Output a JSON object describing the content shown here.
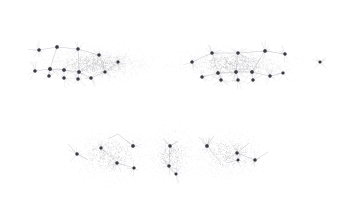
{
  "figure": {
    "title": "",
    "subtitle": "",
    "background_color": "#ffffff",
    "frame": {
      "visible": true,
      "x": 20,
      "y": 9,
      "width": 318,
      "height": 185,
      "border_color": "#dcdcdc",
      "border_width": 1,
      "fill_color": "#ffffff"
    },
    "axes": {
      "visible": false,
      "ticks": false,
      "tick_labels": false,
      "grid": false,
      "xlabel": "",
      "ylabel": ""
    },
    "legend": {
      "visible": false,
      "entries": []
    },
    "annotations": []
  },
  "style": {
    "cloud_point_color": "#b9b9bd",
    "cloud_point_color_light": "#d7d7da",
    "node_color": "#3a3a44",
    "node_edge_color": "#26262e",
    "edge_color": "#9a9aa2",
    "edge_color_faint": "#c6c6cc",
    "cloud_point_radius": 0.45,
    "node_radius": 1.45,
    "edge_width": 0.5
  },
  "chart_data": {
    "type": "scatter",
    "title": "",
    "xlabel": "",
    "ylabel": "",
    "xlim": [
      20,
      338
    ],
    "ylim": [
      9,
      194
    ],
    "grid": false,
    "legend_position": "none",
    "description": "Sparse point-cloud clusters with darker node markers and faint connecting edges; no axes, ticks or labels are drawn.",
    "clusters": [
      {
        "name": "top-left-group",
        "center": [
          96,
          64
        ],
        "extent": [
          66,
          20
        ],
        "cloud_points": 1750,
        "cloud_sigma": [
          27,
          8
        ],
        "nodes": [
          {
            "x": 39,
            "y": 50,
            "size": 1.5
          },
          {
            "x": 57,
            "y": 47,
            "size": 1.6
          },
          {
            "x": 78,
            "y": 49,
            "size": 1.5
          },
          {
            "x": 99,
            "y": 55,
            "size": 1.5
          },
          {
            "x": 35,
            "y": 71,
            "size": 1.5
          },
          {
            "x": 50,
            "y": 69,
            "size": 1.7
          },
          {
            "x": 49,
            "y": 76,
            "size": 1.5
          },
          {
            "x": 64,
            "y": 70,
            "size": 1.6
          },
          {
            "x": 64,
            "y": 78,
            "size": 1.5
          },
          {
            "x": 79,
            "y": 72,
            "size": 1.6
          },
          {
            "x": 78,
            "y": 79,
            "size": 1.5
          },
          {
            "x": 91,
            "y": 78,
            "size": 1.5
          },
          {
            "x": 105,
            "y": 72,
            "size": 1.4
          },
          {
            "x": 118,
            "y": 62,
            "size": 1.4
          }
        ],
        "edges": [
          [
            39,
            50,
            57,
            47
          ],
          [
            57,
            47,
            78,
            49
          ],
          [
            78,
            49,
            99,
            55
          ],
          [
            35,
            71,
            50,
            69
          ],
          [
            50,
            69,
            64,
            70
          ],
          [
            64,
            70,
            79,
            72
          ],
          [
            79,
            72,
            91,
            78
          ],
          [
            91,
            78,
            105,
            72
          ],
          [
            105,
            72,
            118,
            62
          ],
          [
            50,
            69,
            49,
            76
          ],
          [
            64,
            70,
            64,
            78
          ],
          [
            79,
            72,
            78,
            79
          ],
          [
            57,
            47,
            50,
            69
          ],
          [
            78,
            49,
            79,
            72
          ],
          [
            99,
            55,
            105,
            72
          ]
        ]
      },
      {
        "name": "top-right-group",
        "center": [
          235,
          64
        ],
        "extent": [
          62,
          20
        ],
        "cloud_points": 1650,
        "cloud_sigma": [
          26,
          8
        ],
        "nodes": [
          {
            "x": 192,
            "y": 62,
            "size": 1.5
          },
          {
            "x": 212,
            "y": 53,
            "size": 1.5
          },
          {
            "x": 238,
            "y": 53,
            "size": 1.5
          },
          {
            "x": 265,
            "y": 51,
            "size": 1.6
          },
          {
            "x": 285,
            "y": 54,
            "size": 1.5
          },
          {
            "x": 202,
            "y": 77,
            "size": 1.5
          },
          {
            "x": 218,
            "y": 73,
            "size": 1.6
          },
          {
            "x": 221,
            "y": 80,
            "size": 1.5
          },
          {
            "x": 236,
            "y": 72,
            "size": 1.6
          },
          {
            "x": 238,
            "y": 80,
            "size": 1.5
          },
          {
            "x": 252,
            "y": 72,
            "size": 1.6
          },
          {
            "x": 253,
            "y": 80,
            "size": 1.5
          },
          {
            "x": 270,
            "y": 76,
            "size": 1.5
          },
          {
            "x": 283,
            "y": 73,
            "size": 1.4
          }
        ],
        "edges": [
          [
            192,
            62,
            212,
            53
          ],
          [
            212,
            53,
            238,
            53
          ],
          [
            238,
            53,
            265,
            51
          ],
          [
            265,
            51,
            285,
            54
          ],
          [
            202,
            77,
            218,
            73
          ],
          [
            218,
            73,
            236,
            72
          ],
          [
            236,
            72,
            252,
            72
          ],
          [
            252,
            72,
            270,
            76
          ],
          [
            270,
            76,
            283,
            73
          ],
          [
            218,
            73,
            221,
            80
          ],
          [
            236,
            72,
            238,
            80
          ],
          [
            252,
            72,
            253,
            80
          ],
          [
            212,
            53,
            218,
            73
          ],
          [
            238,
            53,
            236,
            72
          ],
          [
            265,
            51,
            252,
            72
          ]
        ]
      },
      {
        "name": "isolated-point-right",
        "center": [
          320,
          62
        ],
        "extent": [
          3,
          3
        ],
        "cloud_points": 6,
        "cloud_sigma": [
          2,
          2
        ],
        "nodes": [
          {
            "x": 320,
            "y": 62,
            "size": 1.3
          }
        ],
        "edges": []
      },
      {
        "name": "bottom-left-group",
        "center": [
          110,
          155
        ],
        "extent": [
          45,
          25
        ],
        "cloud_points": 900,
        "cloud_sigma": [
          21,
          12
        ],
        "nodes": [
          {
            "x": 77,
            "y": 154,
            "size": 1.5
          },
          {
            "x": 101,
            "y": 148,
            "size": 1.4
          },
          {
            "x": 117,
            "y": 163,
            "size": 1.5
          },
          {
            "x": 133,
            "y": 146,
            "size": 1.6
          },
          {
            "x": 134,
            "y": 168,
            "size": 1.4
          }
        ],
        "edges": [
          [
            68,
            144,
            77,
            154
          ],
          [
            77,
            154,
            88,
            160
          ],
          [
            101,
            148,
            117,
            163
          ],
          [
            117,
            163,
            134,
            168
          ],
          [
            133,
            146,
            118,
            134
          ],
          [
            118,
            134,
            108,
            139
          ],
          [
            133,
            146,
            126,
            140
          ]
        ]
      },
      {
        "name": "bottom-middle-group",
        "center": [
          172,
          155
        ],
        "extent": [
          22,
          26
        ],
        "cloud_points": 620,
        "cloud_sigma": [
          11,
          13
        ],
        "nodes": [
          {
            "x": 170,
            "y": 146,
            "size": 1.5
          },
          {
            "x": 169,
            "y": 166,
            "size": 1.5
          },
          {
            "x": 176,
            "y": 174,
            "size": 1.3
          }
        ],
        "edges": [
          [
            170,
            146,
            163,
            138
          ],
          [
            170,
            146,
            178,
            141
          ],
          [
            169,
            166,
            176,
            174
          ],
          [
            169,
            166,
            162,
            158
          ],
          [
            170,
            146,
            169,
            166
          ]
        ]
      },
      {
        "name": "bottom-right-group",
        "center": [
          228,
          154
        ],
        "extent": [
          35,
          25
        ],
        "cloud_points": 820,
        "cloud_sigma": [
          18,
          12
        ],
        "nodes": [
          {
            "x": 207,
            "y": 146,
            "size": 1.6
          },
          {
            "x": 237,
            "y": 153,
            "size": 1.5
          },
          {
            "x": 238,
            "y": 160,
            "size": 1.3
          },
          {
            "x": 255,
            "y": 160,
            "size": 1.5
          }
        ],
        "edges": [
          [
            207,
            146,
            199,
            137
          ],
          [
            207,
            146,
            214,
            136
          ],
          [
            207,
            146,
            210,
            138
          ],
          [
            207,
            146,
            221,
            163
          ],
          [
            237,
            153,
            249,
            143
          ],
          [
            237,
            153,
            255,
            160
          ],
          [
            255,
            160,
            268,
            152
          ],
          [
            238,
            160,
            226,
            163
          ]
        ]
      }
    ]
  }
}
